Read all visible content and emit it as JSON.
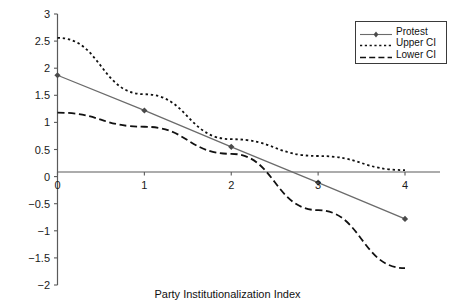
{
  "chart_data": {
    "type": "line",
    "title": "",
    "xlabel": "Party Institutionalization Index",
    "ylabel": "",
    "x": [
      0,
      1,
      2,
      3,
      4
    ],
    "xlim": [
      0,
      4
    ],
    "ylim": [
      -2,
      3
    ],
    "xticks": [
      "0",
      "1",
      "2",
      "3",
      "4"
    ],
    "yticks": [
      "3",
      "2.5",
      "2",
      "1.5",
      "1",
      "0.5",
      "0",
      "-0.5",
      "-1",
      "-1.5",
      "-2"
    ],
    "grid": false,
    "legend_position": "top-right",
    "series": [
      {
        "name": "Protest",
        "values": [
          1.87,
          1.22,
          0.55,
          -0.11,
          -0.78
        ],
        "style": "solid",
        "marker": "diamond",
        "color": "#6b6b6b"
      },
      {
        "name": "Upper CI",
        "values": [
          2.56,
          1.52,
          0.69,
          0.38,
          0.12
        ],
        "style": "dotted",
        "marker": "none",
        "color": "#111111"
      },
      {
        "name": "Lower CI",
        "values": [
          1.18,
          0.92,
          0.42,
          -0.62,
          -1.69
        ],
        "style": "dashed",
        "marker": "none",
        "color": "#111111"
      }
    ]
  },
  "legend": {
    "items": [
      {
        "label": "Protest"
      },
      {
        "label": "Upper CI"
      },
      {
        "label": "Lower CI"
      }
    ]
  },
  "axes": {
    "x_title": "Party Institutionalization Index",
    "y_tick_labels": [
      "3",
      "2.5",
      "2",
      "1.5",
      "1",
      "0.5",
      "0",
      "-0.5",
      "-1",
      "-1.5",
      "-2"
    ],
    "x_tick_labels": [
      "0",
      "1",
      "2",
      "3",
      "4"
    ]
  },
  "colors": {
    "protest": "#6b6b6b",
    "upper_ci": "#111111",
    "lower_ci": "#111111",
    "axis": "#555555",
    "text": "#111111"
  }
}
